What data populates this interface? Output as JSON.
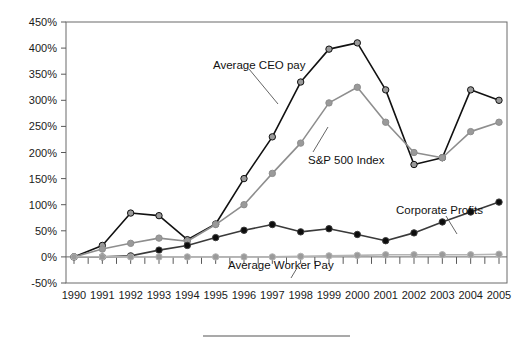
{
  "chart_data": {
    "type": "line",
    "title": "",
    "subtitle": "",
    "xlabel": "",
    "ylabel": "",
    "categories": [
      "1990",
      "1991",
      "1992",
      "1993",
      "1994",
      "1995",
      "1996",
      "1997",
      "1998",
      "1999",
      "2000",
      "2001",
      "2002",
      "2003",
      "2004",
      "2005"
    ],
    "x": [
      1990,
      1991,
      1992,
      1993,
      1994,
      1995,
      1996,
      1997,
      1998,
      1999,
      2000,
      2001,
      2002,
      2003,
      2004,
      2005
    ],
    "ylim": [
      -50,
      450
    ],
    "ystep": 50,
    "ytick_labels": [
      "450%",
      "400%",
      "350%",
      "300%",
      "250%",
      "200%",
      "150%",
      "100%",
      "50%",
      "0%",
      "-50%"
    ],
    "ytick_values": [
      450,
      400,
      350,
      300,
      250,
      200,
      150,
      100,
      50,
      0,
      -50
    ],
    "xtick_labels": [
      "1990",
      "1991",
      "1992",
      "1993",
      "1994",
      "1995",
      "1996",
      "1997",
      "1998",
      "1999",
      "2000",
      "2001",
      "2002",
      "2003",
      "2004",
      "2005"
    ],
    "grid": false,
    "legend_position": "inline-annotations",
    "series": [
      {
        "name": "Average CEO pay",
        "color": "#111111",
        "marker_fill": "#9a9a9a",
        "marker": "circle",
        "values": [
          0,
          22,
          84,
          79,
          33,
          63,
          150,
          230,
          335,
          398,
          410,
          320,
          177,
          190,
          320,
          300
        ]
      },
      {
        "name": "S&P 500 Index",
        "color": "#8e8e8e",
        "marker_fill": "#9a9a9a",
        "marker": "circle",
        "values": [
          0,
          15,
          26,
          36,
          30,
          62,
          100,
          160,
          218,
          295,
          325,
          258,
          200,
          190,
          240,
          258
        ]
      },
      {
        "name": "Corporate Profits",
        "color": "#3a3a3a",
        "marker_fill": "#0d0d0d",
        "marker": "circle",
        "values": [
          0,
          0,
          2,
          13,
          22,
          37,
          51,
          62,
          48,
          54,
          43,
          31,
          46,
          67,
          86,
          105
        ]
      },
      {
        "name": "Average Worker Pay",
        "color": "#b4b4b4",
        "marker_fill": "#9a9a9a",
        "marker": "circle",
        "values": [
          0,
          0,
          0,
          0,
          0,
          0,
          0,
          0,
          1,
          2,
          3,
          4,
          4,
          4,
          4,
          5
        ]
      }
    ],
    "annotations": [
      {
        "text": "Average CEO pay",
        "series": "Average CEO pay"
      },
      {
        "text": "S&P 500 Index",
        "series": "S&P 500 Index"
      },
      {
        "text": "Corporate Profits",
        "series": "Corporate Profits"
      },
      {
        "text": "Average Worker Pay",
        "series": "Average Worker Pay"
      }
    ]
  },
  "annotations": {
    "ceo": "Average CEO pay",
    "sp500": "S&P 500 Index",
    "profits": "Corporate Profits",
    "worker": "Average Worker Pay"
  },
  "yticks": {
    "t450": "450%",
    "t400": "400%",
    "t350": "350%",
    "t300": "300%",
    "t250": "250%",
    "t200": "200%",
    "t150": "150%",
    "t100": "100%",
    "t50": "50%",
    "t0": "0%",
    "tm50": "-50%"
  },
  "xticks": {
    "y1990": "1990",
    "y1991": "1991",
    "y1992": "1992",
    "y1993": "1993",
    "y1994": "1994",
    "y1995": "1995",
    "y1996": "1996",
    "y1997": "1997",
    "y1998": "1998",
    "y1999": "1999",
    "y2000": "2000",
    "y2001": "2001",
    "y2002": "2002",
    "y2003": "2003",
    "y2004": "2004",
    "y2005": "2005"
  }
}
